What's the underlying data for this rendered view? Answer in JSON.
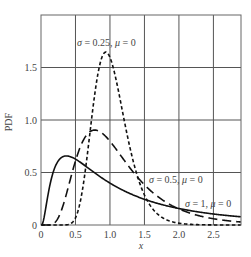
{
  "chart_data": {
    "type": "line",
    "title": "",
    "xlabel": "x",
    "ylabel": "PDF",
    "xlim": [
      0,
      2.9
    ],
    "ylim": [
      0,
      2.0
    ],
    "grid": true,
    "legend": "inline annotations",
    "x_ticks": [
      "0",
      "0.5",
      "1.0",
      "1.5",
      "2.0",
      "2.5"
    ],
    "x_tick_values": [
      0,
      0.5,
      1.0,
      1.5,
      2.0,
      2.5
    ],
    "y_ticks": [
      "0",
      "0.5",
      "1.0",
      "1.5"
    ],
    "y_tick_values": [
      0,
      0.5,
      1.0,
      1.5
    ],
    "series": [
      {
        "name": "σ = 0.25, μ = 0",
        "style": "short-dash",
        "x": [
          0.01,
          0.4,
          0.5,
          0.6,
          0.7,
          0.8,
          0.9,
          0.95,
          1.0,
          1.1,
          1.2,
          1.3,
          1.5,
          1.75,
          2.0,
          2.5,
          2.9
        ],
        "values": [
          0,
          0.006,
          0.069,
          0.33,
          0.824,
          1.34,
          1.622,
          1.645,
          1.596,
          1.349,
          1.02,
          0.708,
          0.286,
          0.075,
          0.017,
          0.001,
          0.0
        ]
      },
      {
        "name": "σ = 0.5, μ = 0",
        "style": "long-dash",
        "x": [
          0.01,
          0.2,
          0.3,
          0.4,
          0.5,
          0.6,
          0.75,
          0.9,
          1.0,
          1.25,
          1.5,
          2.0,
          2.5,
          2.9
        ],
        "values": [
          0,
          0.022,
          0.146,
          0.372,
          0.611,
          0.789,
          0.901,
          0.867,
          0.798,
          0.578,
          0.383,
          0.153,
          0.059,
          0.028
        ]
      },
      {
        "name": "σ = 1, μ = 0",
        "style": "solid",
        "x": [
          0.01,
          0.1,
          0.2,
          0.3,
          0.4,
          0.5,
          0.75,
          1.0,
          1.5,
          2.0,
          2.5,
          2.9
        ],
        "values": [
          0,
          0.282,
          0.546,
          0.644,
          0.655,
          0.627,
          0.51,
          0.399,
          0.245,
          0.157,
          0.105,
          0.078
        ]
      }
    ],
    "annotations": [
      {
        "text": "σ = 0.25, μ = 0",
        "x": 0.95,
        "y": 1.8
      },
      {
        "text": "σ = 0.5, μ = 0",
        "x": 1.6,
        "y": 0.42
      },
      {
        "text": "σ = 1, μ = 0",
        "x": 2.2,
        "y": 0.24
      }
    ]
  },
  "labels": {
    "ylabel": "PDF",
    "xlabel": "x",
    "ann_025_sigma": "σ",
    "ann_025_rest": " = 0.25, ",
    "ann_025_mu": "μ",
    "ann_025_end": " = 0",
    "ann_05_sigma": "σ",
    "ann_05_rest": " = 0.5, ",
    "ann_05_mu": "μ",
    "ann_05_end": " = 0",
    "ann_1_sigma": "σ",
    "ann_1_rest": " = 1, ",
    "ann_1_mu": "μ",
    "ann_1_end": " = 0"
  },
  "colors": {
    "curve": "#111111",
    "grid": "#555555",
    "text": "#444444"
  }
}
